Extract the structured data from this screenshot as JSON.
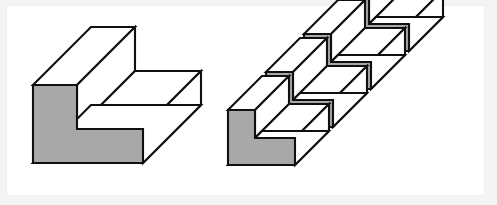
{
  "page": {
    "background_color": "#f4f4f4",
    "canvas_color": "#ffffff",
    "canvas": {
      "x": 7,
      "y": 6,
      "width": 477,
      "height": 189
    },
    "width": 497,
    "height": 205
  },
  "style": {
    "outline_color": "#101010",
    "outline_width": 2.1,
    "front_face_color": "#a8a8a8",
    "top_face_color": "#ffffff",
    "side_face_color": "#ffffff",
    "projection": "oblique-45",
    "depth_dx": 58,
    "depth_dy": -58
  },
  "figures": [
    {
      "id": "single-l-block",
      "label": "Single L-shaped prism",
      "position": "left",
      "block_count": 1,
      "front_profile": {
        "description": "L-shaped (step) polygon outline in local units",
        "points": [
          [
            33,
            85
          ],
          [
            77,
            85
          ],
          [
            77,
            129
          ],
          [
            143,
            129
          ],
          [
            143,
            163
          ],
          [
            33,
            163
          ]
        ]
      },
      "faces": [
        {
          "name": "front-face",
          "shading": "gray",
          "color": "#a8a8a8"
        },
        {
          "name": "top-face-upper-arm",
          "shading": "white",
          "color": "#ffffff"
        },
        {
          "name": "top-face-lower-arm",
          "shading": "white",
          "color": "#ffffff"
        },
        {
          "name": "inner-vertical-face",
          "shading": "white",
          "color": "#ffffff"
        },
        {
          "name": "right-end-face",
          "shading": "white",
          "color": "#ffffff"
        },
        {
          "name": "bottom-front-face",
          "shading": "white",
          "color": "#ffffff"
        }
      ]
    },
    {
      "id": "staircase-l-blocks",
      "label": "Staircase of four L-shaped prisms",
      "position": "right",
      "block_count": 4,
      "arrangement": "diagonal cascade up-and-right",
      "step_offset": {
        "dx": 38,
        "dy": -38
      },
      "origin": {
        "x": 228,
        "y": 110
      },
      "block_dimensions": {
        "arm_width": 27,
        "tall_height": 55,
        "foot_length": 67,
        "foot_height": 27,
        "depth": 34
      },
      "faces": [
        {
          "name": "front-face",
          "shading": "gray",
          "color": "#a8a8a8"
        },
        {
          "name": "top-face",
          "shading": "white",
          "color": "#ffffff"
        },
        {
          "name": "side-face",
          "shading": "white",
          "color": "#ffffff"
        }
      ]
    }
  ]
}
